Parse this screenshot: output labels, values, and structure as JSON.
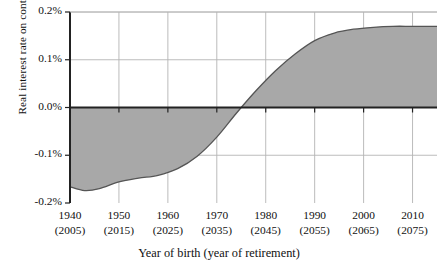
{
  "chart_data": {
    "type": "area",
    "title": "",
    "xlabel": "Year of birth (year of retirement)",
    "ylabel": "Real interest rate on contributions",
    "xlim": [
      1940,
      2015
    ],
    "ylim": [
      -0.2,
      0.2
    ],
    "grid": true,
    "legend": false,
    "y_ticks": [
      "0.2%",
      "0.1%",
      "0.0%",
      "-0.1%",
      "-0.2%"
    ],
    "y_tick_values": [
      0.2,
      0.1,
      0.0,
      -0.1,
      -0.2
    ],
    "x_ticks": [
      {
        "birth": "1940",
        "retirement": "(2005)"
      },
      {
        "birth": "1950",
        "retirement": "(2015)"
      },
      {
        "birth": "1960",
        "retirement": "(2025)"
      },
      {
        "birth": "1970",
        "retirement": "(2035)"
      },
      {
        "birth": "1980",
        "retirement": "(2045)"
      },
      {
        "birth": "1990",
        "retirement": "(2055)"
      },
      {
        "birth": "2000",
        "retirement": "(2065)"
      },
      {
        "birth": "2010",
        "retirement": "(2075)"
      }
    ],
    "x": [
      1940,
      1943,
      1946,
      1950,
      1954,
      1958,
      1962,
      1966,
      1970,
      1974,
      1978,
      1982,
      1986,
      1990,
      1994,
      1998,
      2002,
      2006,
      2010,
      2015
    ],
    "values": [
      -0.166,
      -0.174,
      -0.17,
      -0.156,
      -0.148,
      -0.142,
      -0.128,
      -0.102,
      -0.062,
      -0.012,
      0.035,
      0.077,
      0.112,
      0.14,
      0.156,
      0.164,
      0.168,
      0.17,
      0.17,
      0.17
    ],
    "series": [
      {
        "name": "Real interest rate on contributions",
        "values": [
          -0.166,
          -0.174,
          -0.17,
          -0.156,
          -0.148,
          -0.142,
          -0.128,
          -0.102,
          -0.062,
          -0.012,
          0.035,
          0.077,
          0.112,
          0.14,
          0.156,
          0.164,
          0.168,
          0.17,
          0.17,
          0.17
        ]
      }
    ],
    "baseline": 0.0,
    "fill_color": "#a8a8a8",
    "line_color": "#555555",
    "grid_color": "#b4b4b4",
    "axis_color": "#222222",
    "zero_crossing": 1974
  }
}
